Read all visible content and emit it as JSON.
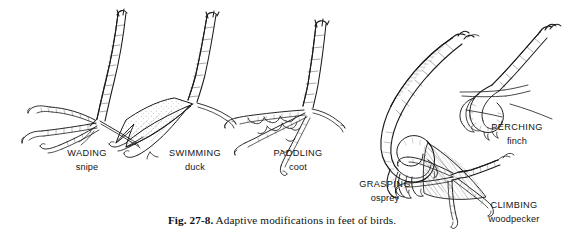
{
  "figure": {
    "caption_number": "Fig. 27-8.",
    "caption_text": " Adaptive modifications in feet of birds.",
    "caption_full": "Fig. 27-8. Adaptive modifications in feet of birds.",
    "background_color": "#ffffff",
    "ink_color": "#141414",
    "style": "black-and-white pen-and-ink scientific illustration"
  },
  "specimens": [
    {
      "id": "wading",
      "mode": "WADING",
      "bird": "snipe",
      "description": "long slender tarsus with three very long thin unwebbed toes spread wide for walking on soft mud"
    },
    {
      "id": "swimming",
      "mode": "SWIMMING",
      "bird": "duck",
      "description": "palmate foot with full triangular web membrane between the three forward toes"
    },
    {
      "id": "paddling",
      "mode": "PADDLING",
      "bird": "coot",
      "description": "lobate foot with scalloped flaps of skin lobed along each separate toe"
    },
    {
      "id": "grasping",
      "mode": "GRASPING",
      "bird": "osprey",
      "description": "raptorial foot with heavy curved leg and long strongly hooked talons curled into a grip"
    },
    {
      "id": "perching",
      "mode": "PERCHING",
      "bird": "finch",
      "description": "anisodactyl perching foot with three toes forward and hallux back clamped around a twig"
    },
    {
      "id": "climbing",
      "mode": "CLIMBING",
      "bird": "woodpecker",
      "description": "zygodactyl foot with two toes forward and two back gripping vertical tree bark"
    }
  ]
}
